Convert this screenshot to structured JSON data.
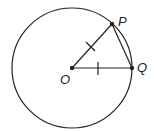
{
  "diagram": {
    "type": "circle-geometry",
    "circle": {
      "cx": 72,
      "cy": 68,
      "r": 60
    },
    "points": {
      "O": {
        "label": "O",
        "x": 72,
        "y": 68
      },
      "P": {
        "label": "P",
        "x": 112,
        "y": 24
      },
      "Q": {
        "label": "Q",
        "x": 132,
        "y": 68
      }
    },
    "segments": [
      "OP",
      "OQ",
      "PQ"
    ],
    "equal_marks": [
      "OP",
      "OQ"
    ],
    "colors": {
      "stroke": "#222222",
      "background": "#ffffff"
    }
  }
}
